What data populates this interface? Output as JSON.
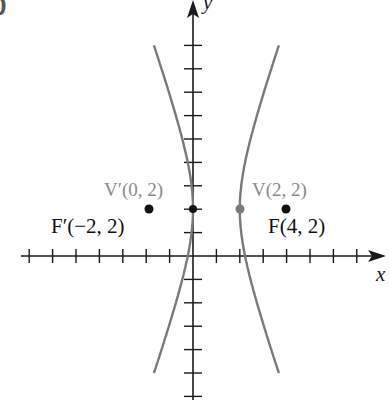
{
  "figure": {
    "corner_fragment": "0",
    "axes": {
      "x_label": "x",
      "y_label": "y",
      "origin_px": [
        193,
        256
      ],
      "unit_px": 23.4,
      "x_ticks": [
        -7,
        -6,
        -5,
        -4,
        -3,
        -2,
        -1,
        1,
        2,
        3,
        4,
        5,
        6,
        7
      ],
      "y_ticks": [
        -6,
        -5,
        -4,
        -3,
        -2,
        -1,
        1,
        2,
        3,
        4,
        5,
        6,
        7,
        8,
        9
      ]
    },
    "hyperbola": {
      "equation": "(x-1)^2/1 - (y-2)^2/8 = 1",
      "center": [
        1,
        2
      ],
      "a": 1,
      "b_squared": 8,
      "color": "#7a7a7a"
    },
    "points": [
      {
        "id": "F-prime",
        "label": "F′(−2, 2)",
        "x": -2,
        "y": 2,
        "color": "#111111",
        "label_color": "#111111"
      },
      {
        "id": "V-prime",
        "label": "V′(0, 2)",
        "x": 0,
        "y": 2,
        "color": "#111111",
        "label_color": "#8a8a8a"
      },
      {
        "id": "V",
        "label": "V(2, 2)",
        "x": 2,
        "y": 2,
        "color": "#7a7a7a",
        "label_color": "#8a8a8a"
      },
      {
        "id": "F",
        "label": "F(4, 2)",
        "x": 4,
        "y": 2,
        "color": "#111111",
        "label_color": "#111111"
      }
    ]
  }
}
